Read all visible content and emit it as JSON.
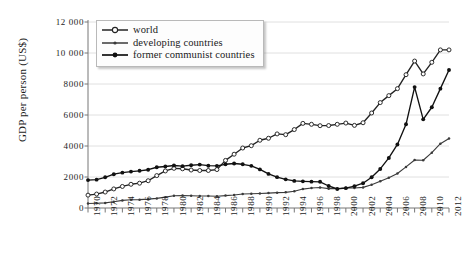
{
  "chart_data": {
    "type": "line",
    "title": "",
    "xlabel": "",
    "ylabel": "GDP per person (US$)",
    "xlim": [
      1970,
      2012
    ],
    "ylim": [
      0,
      12000
    ],
    "grid": true,
    "legend_position": "top-left",
    "ytick_labels": [
      "0",
      "2000",
      "4000",
      "6000",
      "8000",
      "10 000",
      "12 000"
    ],
    "ytick_values": [
      0,
      2000,
      4000,
      6000,
      8000,
      10000,
      12000
    ],
    "xtick_labels": [
      "1970",
      "1972",
      "1974",
      "1976",
      "1978",
      "1980",
      "1982",
      "1984",
      "1986",
      "1988",
      "1990",
      "1992",
      "1994",
      "1996",
      "1998",
      "2000",
      "2002",
      "2004",
      "2006",
      "2008",
      "2010",
      "2012"
    ],
    "xtick_values": [
      1970,
      1972,
      1974,
      1976,
      1978,
      1980,
      1982,
      1984,
      1986,
      1988,
      1990,
      1992,
      1994,
      1996,
      1998,
      2000,
      2002,
      2004,
      2006,
      2008,
      2010,
      2012
    ],
    "x": [
      1970,
      1971,
      1972,
      1973,
      1974,
      1975,
      1976,
      1977,
      1978,
      1979,
      1980,
      1981,
      1982,
      1983,
      1984,
      1985,
      1986,
      1987,
      1988,
      1989,
      1990,
      1991,
      1992,
      1993,
      1994,
      1995,
      1996,
      1997,
      1998,
      1999,
      2000,
      2001,
      2002,
      2003,
      2004,
      2005,
      2006,
      2007,
      2008,
      2009,
      2010,
      2011,
      2012
    ],
    "series": [
      {
        "name": "world",
        "marker": "open-circle",
        "color": "#222222",
        "values": [
          830,
          900,
          1030,
          1230,
          1390,
          1530,
          1600,
          1760,
          2090,
          2390,
          2560,
          2530,
          2450,
          2420,
          2420,
          2480,
          3070,
          3470,
          3870,
          4020,
          4370,
          4500,
          4780,
          4730,
          5060,
          5460,
          5400,
          5310,
          5320,
          5400,
          5480,
          5330,
          5500,
          6130,
          6800,
          7250,
          7700,
          8600,
          9480,
          8650,
          9400,
          10200,
          10200
        ]
      },
      {
        "name": "developing countries",
        "marker": "small-dot",
        "color": "#3a3a3a",
        "values": [
          290,
          305,
          330,
          400,
          490,
          530,
          540,
          570,
          620,
          700,
          790,
          810,
          790,
          770,
          770,
          760,
          800,
          840,
          900,
          920,
          940,
          960,
          990,
          1010,
          1080,
          1220,
          1290,
          1320,
          1250,
          1250,
          1300,
          1290,
          1330,
          1500,
          1720,
          1950,
          2230,
          2650,
          3100,
          3080,
          3570,
          4150,
          4480
        ]
      },
      {
        "name": "former communist countries",
        "marker": "filled-circle",
        "color": "#111111",
        "values": [
          1800,
          1830,
          1980,
          2180,
          2280,
          2350,
          2400,
          2470,
          2630,
          2680,
          2740,
          2700,
          2760,
          2800,
          2730,
          2720,
          2820,
          2870,
          2820,
          2720,
          2490,
          2200,
          1990,
          1850,
          1750,
          1720,
          1700,
          1690,
          1420,
          1230,
          1280,
          1410,
          1600,
          1980,
          2520,
          3230,
          4100,
          5400,
          7800,
          5720,
          6500,
          7700,
          8900
        ]
      }
    ]
  }
}
